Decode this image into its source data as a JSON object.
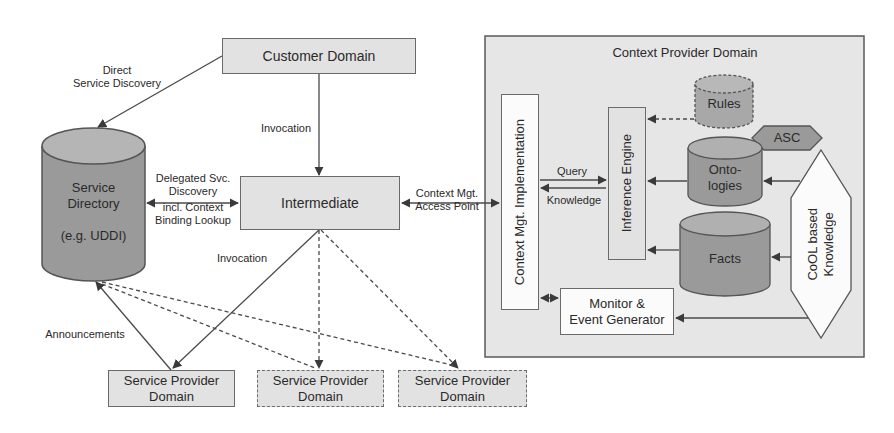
{
  "diagram": {
    "customer_domain": "Customer Domain",
    "intermediate": "Intermediate",
    "service_directory": {
      "line1": "Service",
      "line2": "Directory",
      "line3": "(e.g. UDDI)"
    },
    "context_provider_domain": {
      "title": "Context Provider Domain",
      "context_mgt_impl": "Context Mgt. Implementation",
      "inference_engine": "Inference Engine",
      "rules": "Rules",
      "asc": "ASC",
      "ontologies": {
        "line1": "Onto-",
        "line2": "logies"
      },
      "facts": "Facts",
      "cool_knowledge": {
        "line1": "CoOL based",
        "line2": "Knowledge"
      },
      "monitor": {
        "line1": "Monitor &",
        "line2": "Event Generator"
      }
    },
    "service_providers": [
      {
        "line1": "Service Provider",
        "line2": "Domain",
        "style": "solid"
      },
      {
        "line1": "Service Provider",
        "line2": "Domain",
        "style": "dashed"
      },
      {
        "line1": "Service Provider",
        "line2": "Domain",
        "style": "dashed"
      }
    ],
    "edge_labels": {
      "direct_discovery": {
        "line1": "Direct",
        "line2": "Service Discovery"
      },
      "invocation_top": "Invocation",
      "delegated": {
        "line1": "Delegated Svc.",
        "line2": "Discovery",
        "line3": "incl. Context",
        "line4": "Binding Lookup"
      },
      "context_access": {
        "line1": "Context Mgt.",
        "line2": "Access Point"
      },
      "invocation_bottom": "Invocation",
      "announcements": "Announcements",
      "query": "Query",
      "knowledge": "Knowledge"
    },
    "colors": {
      "box_fill": "#e2e2e2",
      "cylinder_fill": "#9a9a9a",
      "outer_fill": "#e6e6e6",
      "line": "#4a4a4a"
    }
  }
}
